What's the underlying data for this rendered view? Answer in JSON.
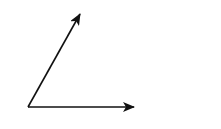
{
  "diagram": {
    "origin": [
      28,
      107
    ],
    "stroke_color": "#111111",
    "background": "#ffffff",
    "vectors": [
      {
        "name": "slanted-vector",
        "from": [
          28,
          107
        ],
        "to": [
          80,
          14
        ]
      },
      {
        "name": "horizontal-vector",
        "from": [
          28,
          107
        ],
        "to": [
          134,
          107
        ]
      }
    ]
  }
}
